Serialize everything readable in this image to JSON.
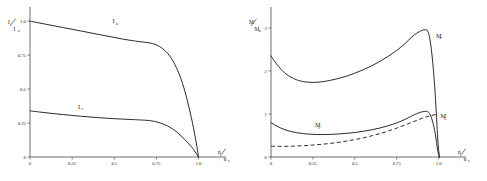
{
  "figure": {
    "panel_count": 2,
    "background": "#ffffff",
    "line_color": "#1f1f1f",
    "axis_color": "#4a4a4a"
  },
  "chart_data": [
    {
      "type": "line",
      "panel": "left",
      "title": "",
      "xlabel": "n/n_s",
      "xlabel_num": "n",
      "xlabel_den": "n",
      "xlabel_den_sub": "s",
      "ylabel": "I/I_a",
      "ylabel_num": "I",
      "ylabel_den": "I",
      "ylabel_den_sub": "a",
      "xlim": [
        0,
        1.08
      ],
      "ylim": [
        0,
        1.06
      ],
      "xticks": [
        0,
        0.25,
        0.5,
        0.75,
        1.0
      ],
      "xticklabels": [
        "0",
        "0.25",
        "0.5",
        "0.75",
        "1.0"
      ],
      "yticks": [
        0,
        0.25,
        0.5,
        0.75,
        1.0
      ],
      "yticklabels": [
        "0",
        "0.25",
        "0.5",
        "0.75",
        "1.0"
      ],
      "grid": false,
      "legend": "inline-labels",
      "series": [
        {
          "name": "I_a",
          "label_main": "I",
          "label_sub": "a",
          "style": "solid",
          "label_x": 0.49,
          "label_y": 0.985,
          "x": [
            0.0,
            0.05,
            0.1,
            0.15,
            0.2,
            0.25,
            0.3,
            0.35,
            0.4,
            0.45,
            0.5,
            0.55,
            0.6,
            0.65,
            0.68,
            0.71,
            0.74,
            0.77,
            0.8,
            0.83,
            0.86,
            0.89,
            0.92,
            0.95,
            0.97,
            0.99,
            1.0
          ],
          "y": [
            1.0,
            0.988,
            0.976,
            0.964,
            0.952,
            0.94,
            0.928,
            0.916,
            0.904,
            0.892,
            0.88,
            0.868,
            0.858,
            0.849,
            0.845,
            0.84,
            0.83,
            0.812,
            0.784,
            0.742,
            0.68,
            0.595,
            0.48,
            0.33,
            0.215,
            0.08,
            0.0
          ]
        },
        {
          "name": "I_v",
          "label_main": "I",
          "label_sub": "v",
          "style": "solid",
          "label_x": 0.285,
          "label_y": 0.355,
          "x": [
            0.0,
            0.05,
            0.1,
            0.15,
            0.2,
            0.25,
            0.3,
            0.35,
            0.4,
            0.45,
            0.5,
            0.55,
            0.6,
            0.65,
            0.68,
            0.71,
            0.74,
            0.77,
            0.8,
            0.83,
            0.86,
            0.89,
            0.92,
            0.95,
            0.97,
            0.99,
            1.0
          ],
          "y": [
            0.34,
            0.332,
            0.325,
            0.318,
            0.312,
            0.306,
            0.3,
            0.295,
            0.29,
            0.286,
            0.282,
            0.279,
            0.276,
            0.273,
            0.271,
            0.268,
            0.262,
            0.252,
            0.238,
            0.219,
            0.194,
            0.163,
            0.127,
            0.086,
            0.056,
            0.02,
            0.0
          ]
        }
      ]
    },
    {
      "type": "line",
      "panel": "right",
      "title": "",
      "xlabel": "n/n_s",
      "xlabel_num": "n",
      "xlabel_den": "n",
      "xlabel_den_sub": "s",
      "ylabel": "M/M_n",
      "ylabel_num": "M",
      "ylabel_den": "M",
      "ylabel_den_sub": "n",
      "xlim": [
        0,
        1.08
      ],
      "ylim": [
        0,
        3.35
      ],
      "xticks": [
        0,
        0.25,
        0.5,
        0.75,
        1.0
      ],
      "xticklabels": [
        "0",
        "0.25",
        "0.5",
        "0.75",
        "1.0"
      ],
      "yticks": [
        0,
        1,
        2,
        3
      ],
      "yticklabels": [
        "0",
        "1",
        "2",
        "3"
      ],
      "grid": false,
      "legend": "inline-labels",
      "series": [
        {
          "name": "M_a",
          "label_main": "M",
          "label_sub": "a",
          "style": "solid",
          "label_x": 0.985,
          "label_y": 2.78,
          "x": [
            0.0,
            0.03,
            0.06,
            0.09,
            0.12,
            0.15,
            0.18,
            0.21,
            0.25,
            0.3,
            0.35,
            0.4,
            0.45,
            0.5,
            0.55,
            0.6,
            0.65,
            0.7,
            0.75,
            0.8,
            0.84,
            0.87,
            0.9,
            0.92,
            0.935,
            0.95,
            0.965,
            0.98,
            0.995,
            1.005
          ],
          "y": [
            2.35,
            2.18,
            2.04,
            1.93,
            1.855,
            1.8,
            1.765,
            1.745,
            1.735,
            1.748,
            1.78,
            1.825,
            1.88,
            1.95,
            2.03,
            2.12,
            2.225,
            2.345,
            2.48,
            2.64,
            2.79,
            2.88,
            2.945,
            2.96,
            2.93,
            2.7,
            2.2,
            1.45,
            0.42,
            0.0
          ]
        },
        {
          "name": "M_v",
          "label_main": "M",
          "label_sub": "v",
          "style": "solid",
          "label_x": 0.262,
          "label_y": 0.69,
          "x": [
            0.0,
            0.03,
            0.06,
            0.09,
            0.12,
            0.15,
            0.18,
            0.21,
            0.25,
            0.3,
            0.35,
            0.4,
            0.45,
            0.5,
            0.55,
            0.6,
            0.65,
            0.7,
            0.75,
            0.8,
            0.84,
            0.87,
            0.9,
            0.92,
            0.935,
            0.95,
            0.965,
            0.98,
            0.995,
            1.005
          ],
          "y": [
            0.8,
            0.73,
            0.67,
            0.625,
            0.592,
            0.568,
            0.55,
            0.537,
            0.527,
            0.522,
            0.525,
            0.535,
            0.55,
            0.57,
            0.598,
            0.632,
            0.675,
            0.728,
            0.793,
            0.875,
            0.955,
            1.01,
            1.05,
            1.062,
            1.055,
            0.985,
            0.81,
            0.54,
            0.15,
            0.0
          ]
        },
        {
          "name": "M_L",
          "label_main": "M",
          "label_sub": "L",
          "style": "dashed",
          "label_x": 1.012,
          "label_y": 0.905,
          "x": [
            0.0,
            0.05,
            0.1,
            0.15,
            0.2,
            0.25,
            0.3,
            0.35,
            0.4,
            0.45,
            0.5,
            0.55,
            0.6,
            0.65,
            0.7,
            0.75,
            0.8,
            0.85,
            0.9,
            0.95,
            1.0
          ],
          "y": [
            0.25,
            0.248,
            0.25,
            0.256,
            0.265,
            0.278,
            0.295,
            0.315,
            0.34,
            0.37,
            0.405,
            0.445,
            0.492,
            0.545,
            0.605,
            0.672,
            0.745,
            0.822,
            0.898,
            0.96,
            1.0
          ]
        }
      ]
    }
  ]
}
